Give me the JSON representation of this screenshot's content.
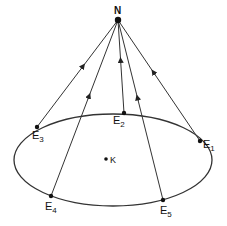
{
  "diagram": {
    "apex": {
      "label": "N",
      "x": 118,
      "y": 20
    },
    "center": {
      "label": "K",
      "x": 111,
      "y": 159
    },
    "ellipse": {
      "cx": 113,
      "cy": 160,
      "rx": 99,
      "ry": 46
    },
    "points": [
      {
        "name": "E",
        "sub": "1",
        "x": 200,
        "y": 141,
        "lx": 203,
        "ly": 148
      },
      {
        "name": "E",
        "sub": "2",
        "x": 124,
        "y": 113,
        "lx": 113,
        "ly": 124
      },
      {
        "name": "E",
        "sub": "3",
        "x": 37,
        "y": 127,
        "lx": 32,
        "ly": 139
      },
      {
        "name": "E",
        "sub": "4",
        "x": 51,
        "y": 196,
        "lx": 45,
        "ly": 210
      },
      {
        "name": "E",
        "sub": "5",
        "x": 163,
        "y": 200,
        "lx": 160,
        "ly": 214
      }
    ],
    "arrow_color": "#222222",
    "line_color": "#333333"
  }
}
